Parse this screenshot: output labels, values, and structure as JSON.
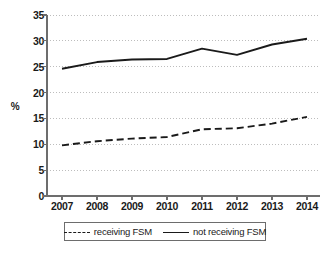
{
  "chart_data": {
    "type": "line",
    "title": "",
    "xlabel": "",
    "ylabel": "%",
    "categories": [
      "2007",
      "2008",
      "2009",
      "2010",
      "2011",
      "2012",
      "2013",
      "2014"
    ],
    "x": [
      2007,
      2008,
      2009,
      2010,
      2011,
      2012,
      2013,
      2014
    ],
    "series": [
      {
        "name": "receiving FSM",
        "style": "dashed",
        "color": "#1a1a1a",
        "values": [
          9.8,
          10.6,
          11.1,
          11.4,
          12.9,
          13.1,
          14.0,
          15.3
        ]
      },
      {
        "name": "not receiving FSM",
        "style": "solid",
        "color": "#1a1a1a",
        "values": [
          24.6,
          25.9,
          26.4,
          26.5,
          28.5,
          27.3,
          29.3,
          30.4
        ]
      }
    ],
    "ylim": [
      0,
      35
    ],
    "yticks": [
      0,
      5,
      10,
      15,
      20,
      25,
      30,
      35
    ],
    "ytick_labels": [
      "0",
      "5",
      "10",
      "15",
      "20",
      "25",
      "30",
      "35"
    ],
    "grid": true,
    "grid_axis": "y",
    "grid_style": "dotted",
    "grid_color": "#bdbdbd",
    "axis_color": "#6d6d6d",
    "legend_position": "bottom",
    "legend": [
      {
        "label": "receiving FSM",
        "style": "dashed"
      },
      {
        "label": "not receiving FSM",
        "style": "solid"
      }
    ]
  }
}
